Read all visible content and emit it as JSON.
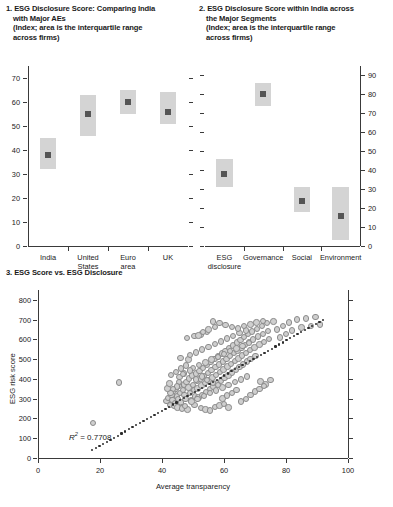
{
  "figure": {
    "background": "#ffffff",
    "box_color": "#d4d4d4",
    "marker_color": "#555555",
    "dot_fill": "#cfcfcf",
    "dot_stroke": "#8a8a8a",
    "axis_color": "#3a3a3a"
  },
  "panel1": {
    "title_line1": "1. ESG Disclosure Score: Comparing India",
    "title_line2": "with Major AEs",
    "title_line3": "(Index; area is the interquartile range",
    "title_line4": "across firms)"
  },
  "panel2": {
    "title_line1": "2. ESG Disclosure Score within India across",
    "title_line2": "the Major Segments",
    "title_line3": "(Index; area is the interquartile range",
    "title_line4": "across firms)"
  },
  "panel3": {
    "title": "3. ESG Score vs. ESG Disclosure",
    "r2_label": "R",
    "r2_sup": "2",
    "r2_value": "= 0.7708"
  },
  "chart_data": [
    {
      "type": "bar",
      "id": "panel1",
      "title": "1. ESG Disclosure Score: Comparing India with Major AEs",
      "subtitle": "(Index; area is the interquartile range across firms)",
      "xlabel": "",
      "ylabel": "",
      "ylim": [
        0,
        75
      ],
      "yticks": [
        0,
        10,
        20,
        30,
        40,
        50,
        60,
        70
      ],
      "ytick_labels": [
        "0",
        "10",
        "20",
        "30",
        "40",
        "50",
        "60",
        "70"
      ],
      "axis_side": "left",
      "grid": false,
      "legend": "none",
      "categories": [
        "India",
        "United States",
        "Euro area",
        "UK"
      ],
      "category_lines": [
        [
          "India"
        ],
        [
          "United",
          "States"
        ],
        [
          "Euro",
          "area"
        ],
        [
          "UK"
        ]
      ],
      "series": [
        {
          "name": "Median (marker)",
          "values": [
            38,
            55,
            60,
            56
          ]
        },
        {
          "name": "IQR lower (box bottom)",
          "values": [
            32,
            46,
            55,
            51
          ]
        },
        {
          "name": "IQR upper (box top)",
          "values": [
            45,
            63,
            65,
            64
          ]
        }
      ]
    },
    {
      "type": "bar",
      "id": "panel2",
      "title": "2. ESG Disclosure Score within India across the Major Segments",
      "subtitle": "(Index; area is the interquartile range across firms)",
      "xlabel": "",
      "ylabel": "",
      "ylim": [
        0,
        95
      ],
      "yticks": [
        0,
        10,
        20,
        30,
        40,
        50,
        60,
        70,
        80,
        90
      ],
      "ytick_labels": [
        "0",
        "10",
        "20",
        "30",
        "40",
        "50",
        "60",
        "70",
        "80",
        "90"
      ],
      "axis_side": "right",
      "grid": false,
      "legend": "none",
      "categories": [
        "ESG disclosure",
        "Governance",
        "Social",
        "Environment"
      ],
      "category_lines": [
        [
          "ESG",
          "disclosure"
        ],
        [
          "Governance"
        ],
        [
          "Social"
        ],
        [
          "Environment"
        ]
      ],
      "series": [
        {
          "name": "Median (marker)",
          "values": [
            38,
            80,
            24,
            16
          ]
        },
        {
          "name": "IQR lower (box bottom)",
          "values": [
            31,
            74,
            18,
            3
          ]
        },
        {
          "name": "IQR upper (box top)",
          "values": [
            46,
            86,
            31,
            31
          ]
        }
      ]
    },
    {
      "type": "scatter",
      "id": "panel3",
      "title": "3. ESG Score vs. ESG Disclosure",
      "xlabel": "Average transparency",
      "ylabel": "ESG risk score",
      "xlim": [
        0,
        100
      ],
      "ylim": [
        0,
        850
      ],
      "xticks": [
        0,
        20,
        40,
        60,
        80,
        100
      ],
      "xtick_labels": [
        "0",
        "20",
        "40",
        "60",
        "80",
        "100"
      ],
      "yticks": [
        0,
        100,
        200,
        300,
        400,
        500,
        600,
        700,
        800
      ],
      "ytick_labels": [
        "0",
        "100",
        "200",
        "300",
        "400",
        "500",
        "600",
        "700",
        "800"
      ],
      "grid": false,
      "legend": "none",
      "annotations": [
        {
          "text": "R2 = 0.7708",
          "x": 12,
          "y": 105
        }
      ],
      "trendline": {
        "type": "dotted",
        "x": [
          17.5,
          92
        ],
        "y": [
          40,
          700
        ]
      },
      "points": [
        [
          17.8,
          178
        ],
        [
          26.2,
          382
        ],
        [
          41.5,
          287
        ],
        [
          42.0,
          305
        ],
        [
          42.6,
          268
        ],
        [
          43.1,
          318
        ],
        [
          43.4,
          292
        ],
        [
          43.8,
          339
        ],
        [
          44.2,
          275
        ],
        [
          44.5,
          352
        ],
        [
          44.9,
          312
        ],
        [
          45.2,
          297
        ],
        [
          45.5,
          365
        ],
        [
          45.8,
          330
        ],
        [
          46.1,
          281
        ],
        [
          46.4,
          258
        ],
        [
          46.7,
          344
        ],
        [
          47.0,
          372
        ],
        [
          47.3,
          320
        ],
        [
          47.6,
          298
        ],
        [
          47.9,
          386
        ],
        [
          48.2,
          245
        ],
        [
          48.5,
          357
        ],
        [
          48.8,
          402
        ],
        [
          49.1,
          330
        ],
        [
          49.4,
          291
        ],
        [
          49.7,
          418
        ],
        [
          50.0,
          368
        ],
        [
          50.3,
          345
        ],
        [
          50.6,
          312
        ],
        [
          50.9,
          428
        ],
        [
          51.2,
          390
        ],
        [
          51.5,
          352
        ],
        [
          51.8,
          306
        ],
        [
          52.1,
          441
        ],
        [
          52.4,
          402
        ],
        [
          52.7,
          366
        ],
        [
          53.0,
          320
        ],
        [
          53.3,
          455
        ],
        [
          53.6,
          416
        ],
        [
          53.9,
          378
        ],
        [
          54.2,
          334
        ],
        [
          54.5,
          470
        ],
        [
          54.8,
          430
        ],
        [
          55.1,
          392
        ],
        [
          55.4,
          348
        ],
        [
          55.7,
          486
        ],
        [
          56.0,
          446
        ],
        [
          56.3,
          408
        ],
        [
          56.6,
          362
        ],
        [
          56.9,
          500
        ],
        [
          57.2,
          460
        ],
        [
          57.5,
          420
        ],
        [
          57.8,
          376
        ],
        [
          58.1,
          514
        ],
        [
          58.4,
          474
        ],
        [
          58.7,
          434
        ],
        [
          59.0,
          390
        ],
        [
          59.3,
          528
        ],
        [
          59.6,
          488
        ],
        [
          59.9,
          448
        ],
        [
          60.2,
          404
        ],
        [
          60.5,
          542
        ],
        [
          60.8,
          502
        ],
        [
          61.1,
          462
        ],
        [
          61.4,
          418
        ],
        [
          61.7,
          556
        ],
        [
          62.0,
          516
        ],
        [
          62.3,
          476
        ],
        [
          62.6,
          432
        ],
        [
          62.9,
          570
        ],
        [
          63.2,
          530
        ],
        [
          63.5,
          490
        ],
        [
          63.8,
          446
        ],
        [
          64.1,
          584
        ],
        [
          64.4,
          544
        ],
        [
          64.7,
          504
        ],
        [
          65.0,
          460
        ],
        [
          65.3,
          598
        ],
        [
          65.6,
          558
        ],
        [
          65.9,
          518
        ],
        [
          66.2,
          474
        ],
        [
          66.5,
          612
        ],
        [
          66.8,
          572
        ],
        [
          67.1,
          532
        ],
        [
          67.4,
          488
        ],
        [
          67.7,
          626
        ],
        [
          68.0,
          586
        ],
        [
          68.3,
          546
        ],
        [
          68.6,
          502
        ],
        [
          69.0,
          640
        ],
        [
          69.4,
          600
        ],
        [
          69.8,
          560
        ],
        [
          70.2,
          516
        ],
        [
          70.6,
          654
        ],
        [
          71.0,
          614
        ],
        [
          71.4,
          574
        ],
        [
          71.8,
          388
        ],
        [
          72.2,
          668
        ],
        [
          72.6,
          628
        ],
        [
          73.0,
          588
        ],
        [
          73.4,
          372
        ],
        [
          73.8,
          682
        ],
        [
          74.2,
          642
        ],
        [
          74.6,
          602
        ],
        [
          75.0,
          396
        ],
        [
          76.0,
          690
        ],
        [
          77.0,
          650
        ],
        [
          78.0,
          610
        ],
        [
          79.0,
          668
        ],
        [
          80.0,
          628
        ],
        [
          81.0,
          686
        ],
        [
          82.0,
          646
        ],
        [
          83.5,
          700
        ],
        [
          85.0,
          660
        ],
        [
          86.5,
          705
        ],
        [
          88.0,
          668
        ],
        [
          89.5,
          712
        ],
        [
          91.0,
          676
        ],
        [
          46.0,
          505
        ],
        [
          48.5,
          498
        ],
        [
          50.5,
          268
        ],
        [
          52.5,
          252
        ],
        [
          54.0,
          246
        ],
        [
          55.5,
          240
        ],
        [
          57.0,
          258
        ],
        [
          58.5,
          266
        ],
        [
          60.0,
          272
        ],
        [
          61.5,
          256
        ],
        [
          44.0,
          262
        ],
        [
          45.0,
          256
        ],
        [
          46.5,
          250
        ],
        [
          47.5,
          264
        ],
        [
          49.0,
          520
        ],
        [
          51.0,
          534
        ],
        [
          53.0,
          548
        ],
        [
          55.0,
          562
        ],
        [
          57.0,
          576
        ],
        [
          59.0,
          590
        ],
        [
          61.0,
          604
        ],
        [
          63.0,
          618
        ],
        [
          65.0,
          632
        ],
        [
          67.0,
          646
        ],
        [
          49.5,
          286
        ],
        [
          51.5,
          300
        ],
        [
          53.5,
          314
        ],
        [
          55.5,
          328
        ],
        [
          57.5,
          342
        ],
        [
          59.5,
          356
        ],
        [
          61.5,
          370
        ],
        [
          63.5,
          384
        ],
        [
          65.5,
          398
        ],
        [
          67.5,
          412
        ],
        [
          50.0,
          456
        ],
        [
          52.0,
          470
        ],
        [
          54.0,
          484
        ],
        [
          56.0,
          498
        ],
        [
          58.0,
          512
        ],
        [
          60.0,
          526
        ],
        [
          62.0,
          540
        ],
        [
          64.0,
          554
        ],
        [
          66.0,
          568
        ],
        [
          68.0,
          582
        ],
        [
          47.0,
          428
        ],
        [
          49.0,
          442
        ],
        [
          51.0,
          398
        ],
        [
          53.0,
          412
        ],
        [
          45.5,
          386
        ],
        [
          44.8,
          362
        ],
        [
          43.5,
          348
        ],
        [
          42.8,
          330
        ],
        [
          56.5,
          690
        ],
        [
          58.5,
          682
        ],
        [
          60.5,
          672
        ],
        [
          62.5,
          664
        ],
        [
          64.5,
          656
        ],
        [
          66.5,
          668
        ],
        [
          68.5,
          676
        ],
        [
          70.5,
          686
        ],
        [
          72.5,
          694
        ],
        [
          48.0,
          608
        ],
        [
          50.5,
          616
        ],
        [
          52.5,
          624
        ],
        [
          54.5,
          636
        ],
        [
          59.5,
          302
        ],
        [
          61.0,
          316
        ],
        [
          62.5,
          330
        ],
        [
          64.0,
          344
        ],
        [
          65.5,
          286
        ],
        [
          67.0,
          300
        ],
        [
          68.5,
          318
        ],
        [
          70.0,
          336
        ],
        [
          71.5,
          350
        ],
        [
          73.0,
          364
        ],
        [
          43.0,
          420
        ],
        [
          44.5,
          436
        ],
        [
          46.2,
          452
        ],
        [
          47.8,
          468
        ],
        [
          54.5,
          394
        ],
        [
          56.5,
          380
        ],
        [
          58.0,
          368
        ],
        [
          51.8,
          620
        ],
        [
          53.2,
          636
        ],
        [
          55.0,
          650
        ],
        [
          57.0,
          662
        ],
        [
          41.8,
          352
        ],
        [
          42.4,
          376
        ],
        [
          45.6,
          410
        ],
        [
          46.8,
          424
        ]
      ]
    }
  ]
}
